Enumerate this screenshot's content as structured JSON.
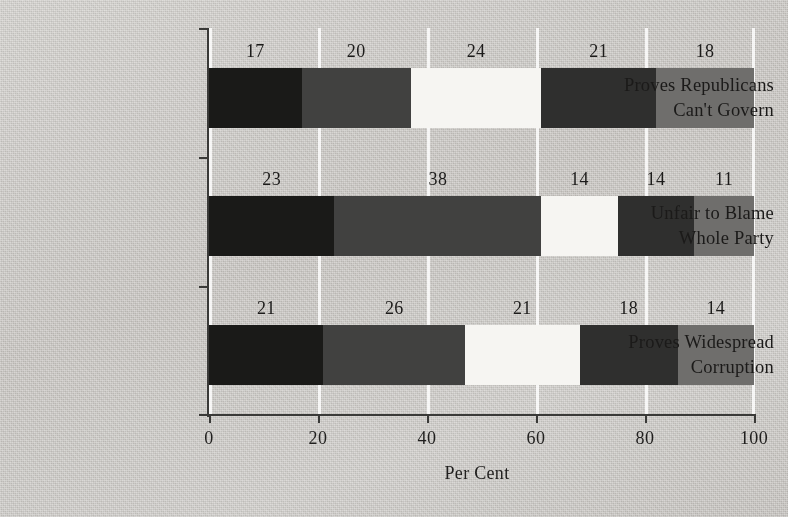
{
  "chart_data": {
    "type": "bar",
    "orientation": "horizontal",
    "stacked": true,
    "title": "",
    "xlabel": "Per Cent",
    "ylabel": "",
    "xlim": [
      0,
      100
    ],
    "xticks": [
      0,
      20,
      40,
      60,
      80,
      100
    ],
    "xticklabels": [
      "0",
      "20",
      "40",
      "60",
      "80",
      "100"
    ],
    "grid": "vertical-white-gridlines",
    "legend": "none",
    "categories": [
      "Proves Republicans Can't Govern",
      "Unfair to Blame Whole Party",
      "Proves Widespread Corruption"
    ],
    "series": [
      {
        "name": "segment-1",
        "color": "#1a1a18",
        "values": [
          17,
          23,
          21
        ]
      },
      {
        "name": "segment-2",
        "color": "#414140",
        "values": [
          20,
          38,
          26
        ]
      },
      {
        "name": "segment-3",
        "color": "#f6f5f2",
        "values": [
          24,
          14,
          21
        ]
      },
      {
        "name": "segment-4",
        "color": "#2f2f2e",
        "values": [
          21,
          14,
          18
        ]
      },
      {
        "name": "segment-5",
        "color": "#6f6e6c",
        "values": [
          18,
          11,
          14
        ]
      }
    ]
  },
  "categories": [
    {
      "line1": "Proves Republicans",
      "line2": "Can't Govern"
    },
    {
      "line1": "Unfair to Blame",
      "line2": "Whole Party"
    },
    {
      "line1": "Proves Widespread",
      "line2": "Corruption"
    }
  ],
  "rows": [
    {
      "labels": [
        "17",
        "20",
        "24",
        "21",
        "18"
      ]
    },
    {
      "labels": [
        "23",
        "38",
        "14",
        "14",
        "11"
      ]
    },
    {
      "labels": [
        "21",
        "26",
        "21",
        "18",
        "14"
      ]
    }
  ],
  "axis": {
    "x_title": "Per Cent",
    "x_tick_labels": [
      "0",
      "20",
      "40",
      "60",
      "80",
      "100"
    ]
  },
  "colors": {
    "background": "#cecbc7",
    "axis": "#3a3a38",
    "gridline": "#ffffff",
    "text": "#1b1a19",
    "seg1": "#1a1a18",
    "seg2": "#414140",
    "seg3": "#f6f5f2",
    "seg4": "#2f2f2e",
    "seg5": "#6f6e6c"
  }
}
